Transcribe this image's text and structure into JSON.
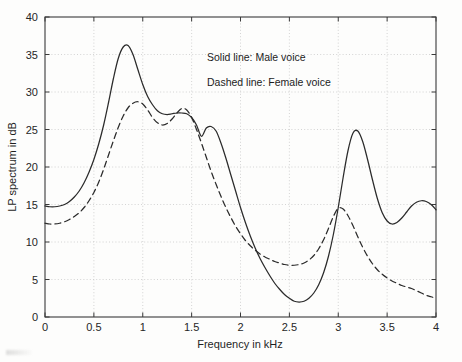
{
  "figure": {
    "background_color": "#fdfdfc",
    "axis_color": "#3a3a3a",
    "grid_color": "#c9c9c9",
    "curve_color": "#2b2b2b"
  },
  "legend": {
    "solid_entry": "Solid line: Male voice",
    "dashed_entry": "Dashed line: Female voice"
  },
  "axis": {
    "x_title": "Frequency in kHz",
    "y_title": "LP spectrum in dB",
    "x_tick_labels": [
      "0",
      "0.5",
      "1",
      "1.5",
      "2",
      "2.5",
      "3",
      "3.5",
      "4"
    ],
    "y_tick_labels": [
      "0",
      "5",
      "10",
      "15",
      "20",
      "25",
      "30",
      "35",
      "40"
    ]
  },
  "chart_data": {
    "type": "line",
    "title": "",
    "subtitle": "",
    "xlabel": "Frequency in kHz",
    "ylabel": "LP spectrum in dB",
    "xlim": [
      0,
      4
    ],
    "ylim": [
      0,
      40
    ],
    "xticks": [
      0,
      0.5,
      1,
      1.5,
      2,
      2.5,
      3,
      3.5,
      4
    ],
    "yticks": [
      0,
      5,
      10,
      15,
      20,
      25,
      30,
      35,
      40
    ],
    "grid": true,
    "grid_style": "dotted",
    "legend_position": "upper-right-inside",
    "legend_entries": [
      "Solid line: Male voice",
      "Dashed line: Female voice"
    ],
    "series": [
      {
        "name": "Male voice",
        "style": "solid",
        "color": "#2b2b2b",
        "annotations": [
          {
            "label": "formant 1 peak",
            "x": 0.7,
            "y": 36.2
          },
          {
            "label": "formant 2 shoulder",
            "x": 1.12,
            "y": 27.1
          },
          {
            "label": "spectral valley",
            "x": 2.1,
            "y": 2.0
          },
          {
            "label": "formant 3 peak",
            "x": 2.9,
            "y": 24.8
          },
          {
            "label": "formant 4 peak",
            "x": 3.5,
            "y": 15.5
          }
        ],
        "x": [
          0.0,
          0.05,
          0.1,
          0.15,
          0.2,
          0.25,
          0.3,
          0.35,
          0.4,
          0.45,
          0.5,
          0.55,
          0.6,
          0.65,
          0.7,
          0.75,
          0.8,
          0.85,
          0.9,
          0.95,
          1.0,
          1.05,
          1.1,
          1.15,
          1.2,
          1.25,
          1.3,
          1.35,
          1.4,
          1.45,
          1.5,
          1.55,
          1.6,
          1.65,
          1.7,
          1.75,
          1.8,
          1.85,
          1.9,
          1.95,
          2.0,
          2.05,
          2.1,
          2.15,
          2.2,
          2.25,
          2.3,
          2.35,
          2.4,
          2.45,
          2.5,
          2.55,
          2.6,
          2.65,
          2.7,
          2.75,
          2.8,
          2.85,
          2.9,
          2.95,
          3.0,
          3.05,
          3.1,
          3.15,
          3.2,
          3.25,
          3.3,
          3.35,
          3.4,
          3.45,
          3.5,
          3.55,
          3.6,
          3.65,
          3.7,
          3.75,
          3.8,
          3.85,
          3.9,
          3.95,
          4.0
        ],
        "y": [
          14.8,
          14.7,
          14.7,
          14.8,
          15.0,
          15.4,
          16.0,
          16.8,
          17.9,
          19.3,
          21.0,
          23.1,
          25.6,
          28.6,
          31.8,
          34.5,
          36.0,
          36.2,
          35.0,
          33.0,
          31.0,
          29.4,
          28.3,
          27.5,
          27.1,
          27.0,
          27.1,
          27.2,
          27.2,
          27.1,
          26.6,
          25.6,
          24.1,
          25.2,
          25.4,
          24.8,
          23.2,
          21.2,
          19.0,
          16.8,
          14.6,
          12.6,
          10.8,
          9.2,
          7.8,
          6.6,
          5.5,
          4.5,
          3.7,
          3.0,
          2.5,
          2.1,
          2.0,
          2.1,
          2.5,
          3.2,
          4.3,
          5.9,
          8.1,
          11.0,
          14.6,
          18.6,
          22.2,
          24.5,
          24.8,
          23.4,
          21.0,
          18.3,
          15.8,
          13.9,
          12.8,
          12.4,
          12.6,
          13.2,
          14.0,
          14.8,
          15.3,
          15.5,
          15.4,
          15.0,
          14.3
        ]
      },
      {
        "name": "Female voice",
        "style": "dashed",
        "color": "#2b2b2b",
        "annotations": [
          {
            "label": "formant 1 peak",
            "x": 0.97,
            "y": 28.7
          },
          {
            "label": "formant 2 peak",
            "x": 1.42,
            "y": 27.8
          },
          {
            "label": "spectral plateau",
            "x": 2.45,
            "y": 7.0
          },
          {
            "label": "formant 3 peak",
            "x": 3.02,
            "y": 14.5
          }
        ],
        "x": [
          0.0,
          0.05,
          0.1,
          0.15,
          0.2,
          0.25,
          0.3,
          0.35,
          0.4,
          0.45,
          0.5,
          0.55,
          0.6,
          0.65,
          0.7,
          0.75,
          0.8,
          0.85,
          0.9,
          0.95,
          1.0,
          1.05,
          1.1,
          1.15,
          1.2,
          1.25,
          1.3,
          1.35,
          1.4,
          1.45,
          1.5,
          1.55,
          1.6,
          1.65,
          1.7,
          1.75,
          1.8,
          1.85,
          1.9,
          1.95,
          2.0,
          2.05,
          2.1,
          2.15,
          2.2,
          2.25,
          2.3,
          2.35,
          2.4,
          2.45,
          2.5,
          2.55,
          2.6,
          2.65,
          2.7,
          2.75,
          2.8,
          2.85,
          2.9,
          2.95,
          3.0,
          3.05,
          3.1,
          3.15,
          3.2,
          3.25,
          3.3,
          3.35,
          3.4,
          3.45,
          3.5,
          3.55,
          3.6,
          3.65,
          3.7,
          3.75,
          3.8,
          3.85,
          3.9,
          3.95,
          4.0
        ],
        "y": [
          12.5,
          12.4,
          12.4,
          12.5,
          12.7,
          13.0,
          13.4,
          13.9,
          14.6,
          15.5,
          16.6,
          18.0,
          19.7,
          21.6,
          23.5,
          25.3,
          26.8,
          27.9,
          28.5,
          28.7,
          28.4,
          27.6,
          26.6,
          25.9,
          25.6,
          25.8,
          26.4,
          27.2,
          27.8,
          27.6,
          26.6,
          25.0,
          23.2,
          21.3,
          19.4,
          17.7,
          16.1,
          14.6,
          13.3,
          12.1,
          11.1,
          10.2,
          9.5,
          8.9,
          8.4,
          8.0,
          7.7,
          7.4,
          7.2,
          7.0,
          6.9,
          6.9,
          7.0,
          7.2,
          7.6,
          8.2,
          9.1,
          10.3,
          11.8,
          13.4,
          14.5,
          14.4,
          13.5,
          12.2,
          10.7,
          9.3,
          8.1,
          7.1,
          6.3,
          5.7,
          5.2,
          4.8,
          4.5,
          4.2,
          4.0,
          3.8,
          3.5,
          3.2,
          2.9,
          2.7,
          2.5
        ]
      }
    ]
  }
}
